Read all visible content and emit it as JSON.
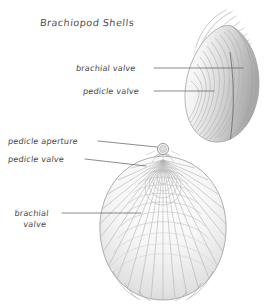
{
  "figure": {
    "title": "Brachiopod Shells",
    "background_color": "#ffffff",
    "ink_color": "#4a4a4a",
    "shell_tone": "#c9c9c9",
    "labels": {
      "brachial_valve_upper": "brachial valve",
      "pedicle_valve_upper": "pedicle valve",
      "pedicle_aperture": "pedicle aperture",
      "pedicle_valve_lower": "pedicle valve",
      "brachial_valve_lower_line1": "brachial",
      "brachial_valve_lower_line2": "valve"
    },
    "specimens": [
      {
        "name": "lateral-view-shell",
        "view": "lateral",
        "features": [
          "beak",
          "growth lines",
          "commissure"
        ]
      },
      {
        "name": "dorsal-view-shell",
        "view": "dorsal",
        "features": [
          "pedicle aperture",
          "interarea",
          "radial ribs",
          "growth lines"
        ]
      }
    ]
  }
}
